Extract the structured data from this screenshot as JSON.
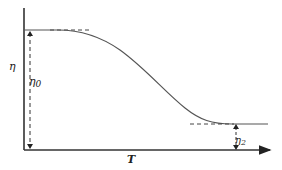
{
  "diagram": {
    "type": "viscosity-vs-temperature curve",
    "y_axis_label": "η",
    "x_axis_label": "T",
    "upper_plateau_label": "η",
    "upper_plateau_subscript": "0",
    "lower_plateau_label": "η",
    "lower_plateau_subscript": "2",
    "colors": {
      "line": "#333333",
      "curve": "#555555",
      "background": "#ffffff"
    }
  }
}
